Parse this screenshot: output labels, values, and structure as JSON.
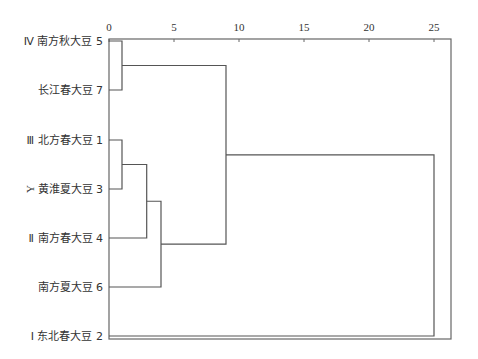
{
  "chart_data": {
    "type": "dendrogram",
    "title": "",
    "xlabel": "",
    "ylabel": "Y",
    "x_ticks": [
      0,
      5,
      10,
      15,
      20,
      25
    ],
    "xlim": [
      0,
      26.3
    ],
    "grid": false,
    "leaves": [
      {
        "id": 5,
        "label": "Ⅳ 南方秋大豆",
        "num": "5"
      },
      {
        "id": 7,
        "label": "长江春大豆",
        "num": "7"
      },
      {
        "id": 1,
        "label": "Ⅲ 北方春大豆",
        "num": "1"
      },
      {
        "id": 3,
        "label": "黄淮夏大豆",
        "num": "3"
      },
      {
        "id": 4,
        "label": "Ⅱ 南方春大豆",
        "num": "4"
      },
      {
        "id": 6,
        "label": "南方夏大豆",
        "num": "6"
      },
      {
        "id": 2,
        "label": "Ⅰ 东北春大豆",
        "num": "2"
      }
    ],
    "merges": [
      {
        "a": "5",
        "b": "7",
        "distance": 1.0
      },
      {
        "a": "1",
        "b": "3",
        "distance": 1.0
      },
      {
        "a": "1,3",
        "b": "4",
        "distance": 2.9
      },
      {
        "a": "1,3,4",
        "b": "6",
        "distance": 4.0
      },
      {
        "a": "5,7",
        "b": "1,3,4,6",
        "distance": 9.0
      },
      {
        "a": "5,7,1,3,4,6",
        "b": "2",
        "distance": 25.0
      }
    ]
  }
}
